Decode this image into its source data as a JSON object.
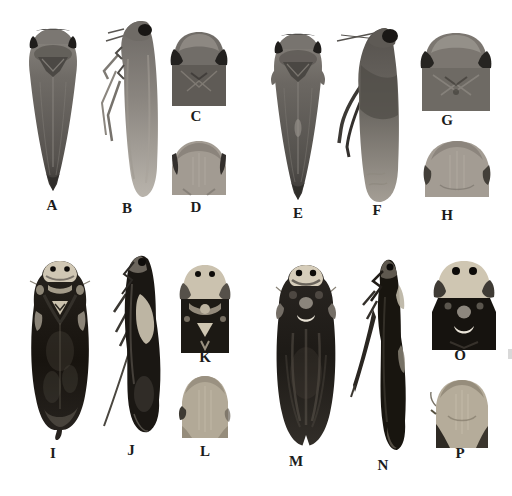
{
  "figure": {
    "type": "taxonomic-specimen-plate",
    "background_color": "#ffffff",
    "label_color": "#1c1c1c",
    "palette": {
      "body_grey": "#6f6b66",
      "body_grey_light": "#a9a49d",
      "body_grey_dark": "#35322f",
      "body_black": "#17130e",
      "cream_head": "#d0c7b4",
      "pale_face": "#b2a997",
      "ocellus_black": "#0d0b09"
    },
    "groups": [
      {
        "name": "specimen-1",
        "tone": "grey-brown",
        "panels": [
          {
            "label": "A",
            "view": "dorsal habitus"
          },
          {
            "label": "B",
            "view": "lateral habitus"
          },
          {
            "label": "C",
            "view": "head and pronotum, dorsal view"
          },
          {
            "label": "D",
            "view": "face, frontal view"
          }
        ]
      },
      {
        "name": "specimen-2",
        "tone": "grey-brown",
        "panels": [
          {
            "label": "E",
            "view": "dorsal habitus"
          },
          {
            "label": "F",
            "view": "lateral habitus"
          },
          {
            "label": "G",
            "view": "head and pronotum, dorsal view"
          },
          {
            "label": "H",
            "view": "face, frontal view"
          }
        ]
      },
      {
        "name": "specimen-3",
        "tone": "black-and-cream",
        "panels": [
          {
            "label": "I",
            "view": "dorsal habitus"
          },
          {
            "label": "J",
            "view": "lateral habitus"
          },
          {
            "label": "K",
            "view": "head and pronotum, dorsal view"
          },
          {
            "label": "L",
            "view": "face, frontal view"
          }
        ]
      },
      {
        "name": "specimen-4",
        "tone": "black-and-cream",
        "panels": [
          {
            "label": "M",
            "view": "dorsal habitus"
          },
          {
            "label": "N",
            "view": "lateral habitus"
          },
          {
            "label": "O",
            "view": "head and pronotum, dorsal view"
          },
          {
            "label": "P",
            "view": "face, frontal view"
          }
        ]
      }
    ]
  }
}
